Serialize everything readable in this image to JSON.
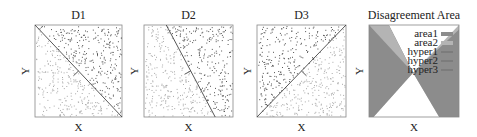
{
  "figure": {
    "panels": [
      {
        "id": "d1",
        "title": "D1",
        "xlabel": "X",
        "ylabel": "Y",
        "box": [
          35,
          25,
          87,
          92
        ],
        "line": [
          [
            0,
            0
          ],
          [
            1,
            1
          ]
        ],
        "normal": "down-right",
        "seed": 11
      },
      {
        "id": "d2",
        "title": "D2",
        "xlabel": "X",
        "ylabel": "Y",
        "box": [
          144,
          25,
          89,
          92
        ],
        "line": [
          [
            0.25,
            0
          ],
          [
            0.8,
            1
          ]
        ],
        "seed": 23
      },
      {
        "id": "d3",
        "title": "D3",
        "xlabel": "X",
        "ylabel": "Y",
        "box": [
          257,
          25,
          89,
          92
        ],
        "line": [
          [
            0,
            1
          ],
          [
            1,
            0
          ]
        ],
        "seed": 37
      }
    ],
    "disagreement": {
      "title": "Disagreement Area",
      "xlabel": "X",
      "ylabel": "Y",
      "box": [
        369,
        25,
        90,
        92
      ],
      "legend": [
        "area1",
        "area2",
        "hyper1",
        "hyper2",
        "hyper3"
      ],
      "colors": {
        "area1": "#8c8c8c",
        "area2": "#b4b4b4",
        "white": "#ffffff"
      }
    }
  },
  "chart_data": {
    "type": "scatter",
    "title": "",
    "panels": [
      {
        "title": "D1",
        "xlabel": "X",
        "ylabel": "Y",
        "decision_boundary": "diagonal from top-left to bottom-right"
      },
      {
        "title": "D2",
        "xlabel": "X",
        "ylabel": "Y",
        "decision_boundary": "steep line from top (x≈0.25) to bottom (x≈0.8)"
      },
      {
        "title": "D3",
        "xlabel": "X",
        "ylabel": "Y",
        "decision_boundary": "diagonal from bottom-left to top-right"
      },
      {
        "title": "Disagreement Area",
        "xlabel": "X",
        "ylabel": "Y",
        "legend": [
          "area1",
          "area2",
          "hyper1",
          "hyper2",
          "hyper3"
        ],
        "description": "shaded regions where the three hyperplanes disagree"
      }
    ]
  }
}
